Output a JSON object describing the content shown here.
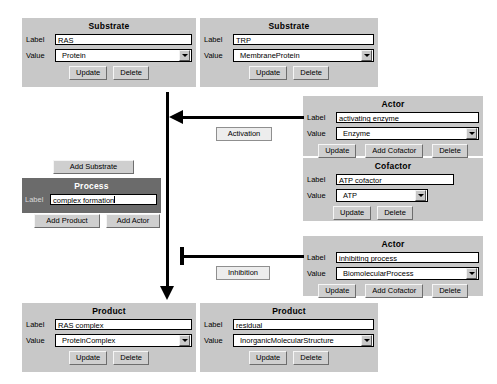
{
  "app": {
    "type": "biological-process-graph-editor"
  },
  "panels": {
    "substrate1": {
      "title": "Substrate",
      "label_caption": "Label",
      "label_value": "RAS",
      "value_caption": "Value",
      "value_selected": "Protein",
      "buttons": [
        "Update",
        "Delete"
      ]
    },
    "substrate2": {
      "title": "Substrate",
      "label_caption": "Label",
      "label_value": "TRP",
      "value_caption": "Value",
      "value_selected": "MembraneProtein",
      "buttons": [
        "Update",
        "Delete"
      ]
    },
    "actor1": {
      "title": "Actor",
      "label_caption": "Label",
      "label_value": "activating enzyme",
      "value_caption": "Value",
      "value_selected": "Enzyme",
      "buttons": [
        "Update",
        "Add Cofactor",
        "Delete"
      ]
    },
    "cofactor": {
      "title": "Cofactor",
      "label_caption": "Label",
      "label_value": "ATP cofactor",
      "value_caption": "Value",
      "value_selected": "ATP",
      "buttons": [
        "Update",
        "Delete"
      ]
    },
    "actor2": {
      "title": "Actor",
      "label_caption": "Label",
      "label_value": "inhibiting process",
      "value_caption": "Value",
      "value_selected": "BiomolecularProcess",
      "buttons": [
        "Update",
        "Add Cofactor",
        "Delete"
      ]
    },
    "process": {
      "title": "Process",
      "label_caption": "Label",
      "label_value": "complex formation",
      "add_substrate": "Add Substrate",
      "add_product": "Add Product",
      "add_actor": "Add Actor"
    },
    "product1": {
      "title": "Product",
      "label_caption": "Label",
      "label_value": "RAS complex",
      "value_caption": "Value",
      "value_selected": "ProteinComplex",
      "buttons": [
        "Update",
        "Delete"
      ]
    },
    "product2": {
      "title": "Product",
      "label_caption": "Label",
      "label_value": "residual",
      "value_caption": "Value",
      "value_selected": "InorganicMolecularStructure",
      "buttons": [
        "Update",
        "Delete"
      ]
    }
  },
  "edges": {
    "activation_label": "Activation",
    "inhibition_label": "Inhibition"
  },
  "colors": {
    "panel_bg": "#c8c8c8",
    "process_bg": "#6b6b6b",
    "process_title": "#ffffff",
    "button_bg": "#cfcfcf",
    "field_bg": "#ffffff",
    "connector": "#000000",
    "page_bg": "#ffffff"
  }
}
